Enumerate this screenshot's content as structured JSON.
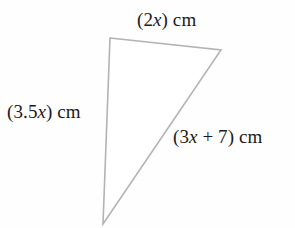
{
  "figure": {
    "name": "triangle-with-algebraic-side-lengths",
    "background_color": "#fefefe",
    "stroke_color": "#b3b3b3",
    "text_color": "#1b1b1b",
    "vertices": {
      "top_left": [
        110,
        38
      ],
      "right": [
        221,
        50
      ],
      "bottom": [
        103,
        224
      ]
    }
  },
  "labels": {
    "top": {
      "full_text": "(2x) cm",
      "prefix": "(2",
      "variable": "x",
      "suffix": ") cm"
    },
    "left": {
      "full_text": "(3.5x) cm",
      "prefix": "(3.5",
      "variable": "x",
      "suffix": ") cm"
    },
    "hypotenuse": {
      "full_text": "(3x + 7) cm",
      "prefix": "(3",
      "variable": "x",
      "suffix": " + 7) cm"
    }
  }
}
